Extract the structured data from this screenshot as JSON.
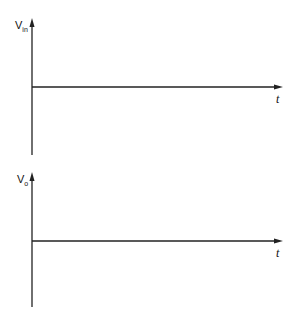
{
  "diagram": {
    "plots": [
      {
        "name": "input-voltage-axes",
        "y_label": "V",
        "y_label_sub": "in",
        "x_label": "t",
        "origin": [
          32,
          87
        ],
        "y_top": 20,
        "y_bottom": 155,
        "x_end": 282
      },
      {
        "name": "output-voltage-axes",
        "y_label": "V",
        "y_label_sub": "o",
        "x_label": "t",
        "origin": [
          32,
          241
        ],
        "y_top": 174,
        "y_bottom": 307,
        "x_end": 282
      }
    ],
    "line_color": "#222222"
  }
}
